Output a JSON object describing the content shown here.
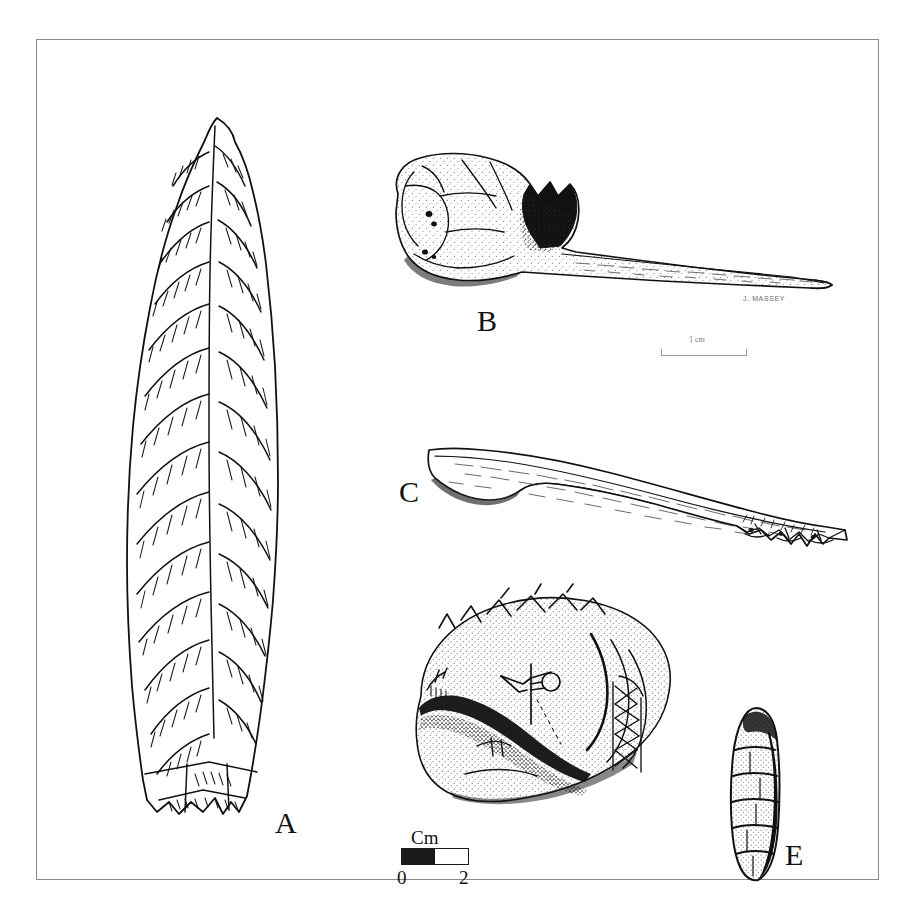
{
  "figure": {
    "kind": "archaeological-artifact-plate",
    "background_color": "#ffffff",
    "ink_color": "#111111",
    "frame_color": "#8a8a8a",
    "illustrator_credit": "J. MASSEY"
  },
  "labels": {
    "a": "A",
    "b": "B",
    "c": "C",
    "e": "E"
  },
  "specimens": [
    {
      "label": "A",
      "name": "chipped-stone-projectile-point",
      "description": "Large bifacially flaked lanceolate projectile point with parallel-oblique flake scars and a notched contracting base",
      "technique": "line drawing with flake-scar hatching"
    },
    {
      "label": "B",
      "name": "bone-awl-articular-handle",
      "description": "Bone awl or pin made on a split long bone retaining the articular end as a handle",
      "technique": "stipple shading with solid black accents"
    },
    {
      "label": "C",
      "name": "bone-point-splintered-base",
      "description": "Slender bone point with tapered tip and splintered, irregular proximal end",
      "technique": "fine linear hatching"
    },
    {
      "label": "D",
      "name": "engraved-shell-gorget",
      "description": "Engraved marine shell gorget with zig-zag border motif, central cross-and-circle figure and cross-hatched panel",
      "technique": "stipple shading with incised line motifs"
    },
    {
      "label": "E",
      "name": "tubular-bone-bead",
      "description": "Small elongate tubular bone bead with transverse incised encircling lines",
      "technique": "stipple and line shading"
    }
  ],
  "scale_bar": {
    "caption": "Cm",
    "unit": "Cm",
    "start_tick": "0",
    "end_tick": "2",
    "segments": 2,
    "filled_color": "#1a1a1a",
    "empty_color": "#ffffff"
  },
  "scale_bar_b": {
    "caption": "1 cm",
    "unit": "cm",
    "value": "1"
  }
}
